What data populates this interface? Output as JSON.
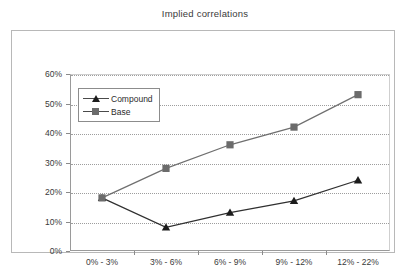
{
  "chart_data": {
    "type": "line",
    "title": "Implied correlations",
    "xlabel": "",
    "ylabel": "",
    "categories": [
      "0% - 3%",
      "3% - 6%",
      "6% - 9%",
      "9% - 12%",
      "12% - 22%"
    ],
    "series": [
      {
        "name": "Compound",
        "marker": "triangle",
        "color": "#1c1c1c",
        "values": [
          18,
          8,
          13,
          17,
          24
        ],
        "value_labels": [
          "18%",
          "8%",
          "13%",
          "17%",
          "24%"
        ]
      },
      {
        "name": "Base",
        "marker": "square",
        "color": "#6b6b6b",
        "values": [
          18,
          28,
          36,
          42,
          53
        ],
        "value_labels": [
          "18%",
          "28%",
          "36%",
          "42%",
          "53%"
        ]
      }
    ],
    "ylim": [
      0,
      60
    ],
    "ytick_step": 10,
    "ytick_labels": [
      "0%",
      "10%",
      "20%",
      "30%",
      "40%",
      "50%",
      "60%"
    ],
    "ytick_values": [
      0,
      10,
      20,
      30,
      40,
      50,
      60
    ],
    "grid": "horizontal-dotted",
    "legend_position": "upper-left-inside",
    "legend_entries": [
      "Compound",
      "Base"
    ]
  }
}
